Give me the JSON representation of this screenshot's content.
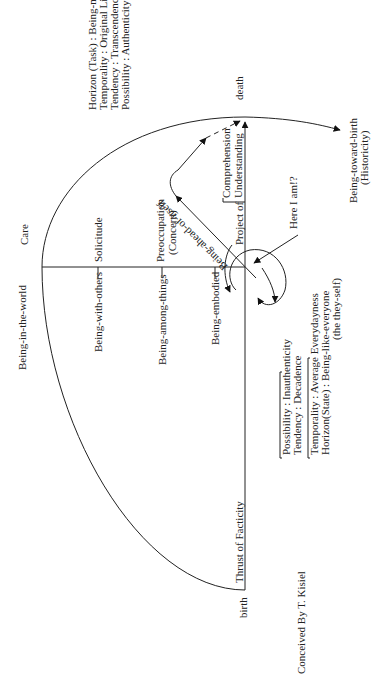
{
  "diagram": {
    "title_care": "Care",
    "being_in_the_world": "Being-in-the-world",
    "axis": {
      "top_label": "death",
      "bottom_label": "birth",
      "bottom_axis_label": "Thrust of Facticity",
      "project_of": "Project of",
      "project_targets": [
        "Comprehension",
        "Understanding"
      ]
    },
    "horizontal_branches": [
      {
        "left": "Being-with-others",
        "right": "Solicitude"
      },
      {
        "left": "Being-among-things",
        "right_lines": [
          "Preoccupation",
          "(Concern)"
        ]
      },
      {
        "left": "Being-embodied"
      }
    ],
    "ahead_of_itself": "Being-ahead-of-itself",
    "here_i_am": "Here I am!?",
    "authentic_block": [
      "Horizon (Task) : Being-myself",
      "Temporality : Original Lifetime",
      "Tendency : Transcendence",
      "Possibility : Authenticity"
    ],
    "inauthentic_block_1": [
      "Possibility : Inauthenticity",
      "Tendency : Decadence"
    ],
    "inauthentic_block_2": [
      "Temporality : Average Everydayness",
      "Horizon(State) : Being-like-everyone",
      "(the they-self)"
    ],
    "being_toward_birth": [
      "Being-toward-birth",
      "(Historicity)"
    ],
    "credit": "Conceived By T. Kisiel"
  }
}
